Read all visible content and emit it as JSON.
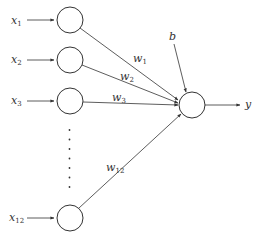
{
  "diagram": {
    "colors": {
      "stroke": "#333333",
      "background": "#ffffff"
    },
    "inputs": [
      {
        "var": "x",
        "sub": "1",
        "y": 20
      },
      {
        "var": "x",
        "sub": "2",
        "y": 60
      },
      {
        "var": "x",
        "sub": "3",
        "y": 101
      },
      {
        "var": "x",
        "sub": "12",
        "y": 218
      }
    ],
    "weights": [
      {
        "var": "w",
        "sub": "1"
      },
      {
        "var": "w",
        "sub": "2"
      },
      {
        "var": "w",
        "sub": "3"
      },
      {
        "var": "w",
        "sub": "12"
      }
    ],
    "ellipsis": "vertical dots (7)",
    "bias": {
      "label": "b"
    },
    "output": {
      "label": "y"
    }
  }
}
